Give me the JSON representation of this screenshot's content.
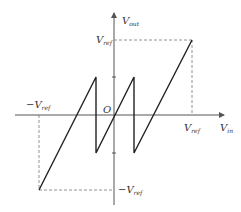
{
  "diagram": {
    "axes": {
      "x_label": "V",
      "x_label_sub": "in",
      "y_label": "V",
      "y_label_sub": "out",
      "origin_label": "O"
    },
    "ticks": {
      "x_pos": {
        "main": "V",
        "sub": "ref"
      },
      "x_neg": {
        "main": "−V",
        "sub": "ref"
      },
      "y_pos": {
        "main": "V",
        "sub": "ref"
      },
      "y_neg": {
        "main": "−V",
        "sub": "ref"
      }
    },
    "colors": {
      "curve": "#222222",
      "axis": "#555555",
      "dashed": "#777777"
    }
  }
}
